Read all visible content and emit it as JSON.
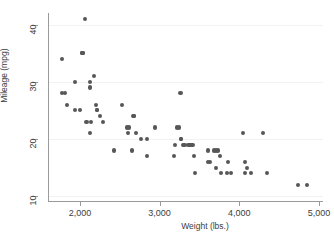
{
  "chart_data": {
    "type": "scatter",
    "title": "",
    "xlabel": "Weight (lbs.)",
    "ylabel": "Mileage (mpg)",
    "xlim": [
      1600,
      5050
    ],
    "ylim": [
      9,
      42
    ],
    "xticks": [
      2000,
      3000,
      4000,
      5000
    ],
    "xtick_labels": [
      "2,000",
      "3,000",
      "4,000",
      "5,000"
    ],
    "yticks": [
      10,
      20,
      30,
      40
    ],
    "ytick_labels": [
      "10",
      "20",
      "30",
      "40"
    ],
    "grid": "horizontal",
    "legend": "none",
    "marker_color": "#575757",
    "marker_shape": "circle",
    "series": [
      {
        "name": "Mileage vs Weight",
        "points": [
          [
            1760,
            28
          ],
          [
            1800,
            28
          ],
          [
            1760,
            34
          ],
          [
            1830,
            26
          ],
          [
            1930,
            25
          ],
          [
            1990,
            25
          ],
          [
            1930,
            30
          ],
          [
            2020,
            35
          ],
          [
            2020,
            35
          ],
          [
            2050,
            41
          ],
          [
            2110,
            30
          ],
          [
            2110,
            29
          ],
          [
            2160,
            31
          ],
          [
            2110,
            21
          ],
          [
            2070,
            23
          ],
          [
            2130,
            23
          ],
          [
            2190,
            26
          ],
          [
            2200,
            25
          ],
          [
            2200,
            25
          ],
          [
            2240,
            24
          ],
          [
            2280,
            23
          ],
          [
            2410,
            18
          ],
          [
            2520,
            26
          ],
          [
            2580,
            22
          ],
          [
            2600,
            22
          ],
          [
            2590,
            21
          ],
          [
            2650,
            24
          ],
          [
            2670,
            24
          ],
          [
            2670,
            24
          ],
          [
            2640,
            18
          ],
          [
            2690,
            21
          ],
          [
            2750,
            20
          ],
          [
            2830,
            17
          ],
          [
            2830,
            20
          ],
          [
            2930,
            22
          ],
          [
            3170,
            17
          ],
          [
            3180,
            19
          ],
          [
            3210,
            22
          ],
          [
            3230,
            22
          ],
          [
            3250,
            28
          ],
          [
            3260,
            20
          ],
          [
            3260,
            20
          ],
          [
            3280,
            19
          ],
          [
            3300,
            19
          ],
          [
            3350,
            19
          ],
          [
            3370,
            19
          ],
          [
            3380,
            19
          ],
          [
            3400,
            19
          ],
          [
            3420,
            17
          ],
          [
            3430,
            14
          ],
          [
            3600,
            16
          ],
          [
            3600,
            18
          ],
          [
            3620,
            16
          ],
          [
            3670,
            18
          ],
          [
            3690,
            18
          ],
          [
            3700,
            15
          ],
          [
            3720,
            18
          ],
          [
            3740,
            17
          ],
          [
            3760,
            14
          ],
          [
            3830,
            14
          ],
          [
            3840,
            16
          ],
          [
            3880,
            14
          ],
          [
            4030,
            21
          ],
          [
            4060,
            16
          ],
          [
            4060,
            14
          ],
          [
            4080,
            15
          ],
          [
            4130,
            14
          ],
          [
            4290,
            21
          ],
          [
            4330,
            14
          ],
          [
            4720,
            12
          ],
          [
            4840,
            12
          ]
        ]
      }
    ]
  },
  "axes": {
    "y_title": "Mileage (mpg)",
    "x_title": "Weight (lbs.)"
  }
}
